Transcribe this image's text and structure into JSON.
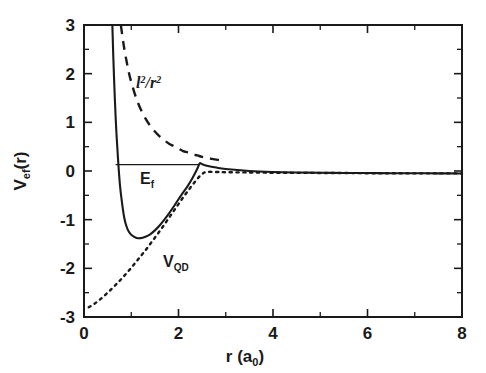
{
  "figure": {
    "background_color": "#ffffff",
    "ink_color": "#1a1a1a"
  },
  "axes": {
    "x_axis_title_main": "r (a",
    "x_axis_title_sub": "0",
    "x_axis_title_close": ")",
    "y_axis_title_main": "V",
    "y_axis_title_sub": "ef",
    "y_axis_title_close": "(r)",
    "x_tick_labels": [
      "0",
      "2",
      "4",
      "6",
      "8"
    ],
    "y_tick_labels": [
      "3",
      "2",
      "1",
      "0",
      "-1",
      "-2",
      "-3"
    ]
  },
  "annotations": {
    "centrifugal_label_main": "l",
    "centrifugal_label_sup1": "2",
    "centrifugal_label_mid": "/r",
    "centrifugal_label_sup2": "2",
    "fermi_label_main": "E",
    "fermi_label_sub": "f",
    "potential_label_main": "V",
    "potential_label_sub": "QD"
  },
  "chart_data": {
    "type": "line",
    "title": "",
    "xlabel": "r (a_0)",
    "ylabel": "V_ef(r)",
    "xlim": [
      0,
      8
    ],
    "ylim": [
      -3,
      3
    ],
    "x_major_ticks": [
      0,
      2,
      4,
      6,
      8
    ],
    "x_minor_ticks": [
      1,
      3,
      5,
      7
    ],
    "y_major_ticks": [
      -3,
      -2,
      -1,
      0,
      1,
      2,
      3
    ],
    "y_minor_ticks": [
      -2.5,
      -1.5,
      -0.5,
      0.5,
      1.5,
      2.5
    ],
    "grid": false,
    "legend": "none",
    "series": [
      {
        "name": "V_ef",
        "style": "solid",
        "label": "V_ef (effective potential)",
        "x": [
          0.6,
          0.62,
          0.65,
          0.68,
          0.72,
          0.76,
          0.8,
          0.85,
          0.9,
          0.95,
          1.0,
          1.1,
          1.2,
          1.3,
          1.4,
          1.5,
          1.6,
          1.7,
          1.8,
          1.9,
          2.0,
          2.1,
          2.2,
          2.3,
          2.4,
          2.45,
          2.5,
          2.6,
          2.8,
          3.0,
          3.5,
          4.0,
          4.5,
          5.0,
          5.5,
          6.0,
          6.5,
          7.0,
          7.5,
          8.0
        ],
        "y": [
          3.0,
          2.35,
          1.55,
          0.9,
          0.25,
          -0.28,
          -0.62,
          -0.95,
          -1.14,
          -1.25,
          -1.31,
          -1.37,
          -1.38,
          -1.35,
          -1.3,
          -1.22,
          -1.12,
          -1.0,
          -0.87,
          -0.73,
          -0.58,
          -0.44,
          -0.3,
          -0.14,
          0.05,
          0.16,
          0.14,
          0.11,
          0.07,
          0.04,
          0.0,
          -0.02,
          -0.03,
          -0.035,
          -0.04,
          -0.042,
          -0.045,
          -0.047,
          -0.048,
          -0.05
        ]
      },
      {
        "name": "l2_over_r2",
        "style": "dashed",
        "label": "l^2/r^2 (centrifugal barrier)",
        "x": [
          0.78,
          0.82,
          0.86,
          0.9,
          0.95,
          1.0,
          1.1,
          1.2,
          1.3,
          1.4,
          1.5,
          1.6,
          1.7,
          1.8,
          1.9,
          2.0,
          2.1,
          2.2,
          2.3,
          2.4,
          2.5,
          2.7,
          3.0
        ],
        "y": [
          3.0,
          2.72,
          2.47,
          2.26,
          2.02,
          1.83,
          1.51,
          1.27,
          1.08,
          0.93,
          0.81,
          0.71,
          0.63,
          0.56,
          0.51,
          0.46,
          0.41,
          0.38,
          0.34,
          0.32,
          0.29,
          0.25,
          0.2
        ]
      },
      {
        "name": "V_QD",
        "style": "dotted",
        "label": "V_QD (quantum dot potential)",
        "x": [
          0.1,
          0.2,
          0.3,
          0.4,
          0.5,
          0.6,
          0.7,
          0.8,
          0.9,
          1.0,
          1.1,
          1.2,
          1.3,
          1.4,
          1.5,
          1.6,
          1.7,
          1.8,
          1.9,
          2.0,
          2.1,
          2.2,
          2.3,
          2.4,
          2.5,
          2.6,
          2.8,
          3.0,
          3.5,
          4.0,
          4.5,
          5.0,
          5.5,
          6.0,
          6.5,
          7.0,
          7.5,
          8.0
        ],
        "y": [
          -2.8,
          -2.74,
          -2.67,
          -2.59,
          -2.5,
          -2.41,
          -2.31,
          -2.21,
          -2.1,
          -1.99,
          -1.87,
          -1.75,
          -1.63,
          -1.5,
          -1.37,
          -1.24,
          -1.1,
          -0.96,
          -0.82,
          -0.68,
          -0.54,
          -0.41,
          -0.28,
          -0.16,
          -0.06,
          -0.02,
          -0.02,
          -0.025,
          -0.03,
          -0.035,
          -0.038,
          -0.04,
          -0.042,
          -0.045,
          -0.047,
          -0.048,
          -0.049,
          -0.05
        ]
      },
      {
        "name": "E_f",
        "style": "level",
        "label": "E_f (Fermi level)",
        "x": [
          0.67,
          2.42
        ],
        "y": [
          0.13,
          0.13
        ]
      }
    ]
  }
}
